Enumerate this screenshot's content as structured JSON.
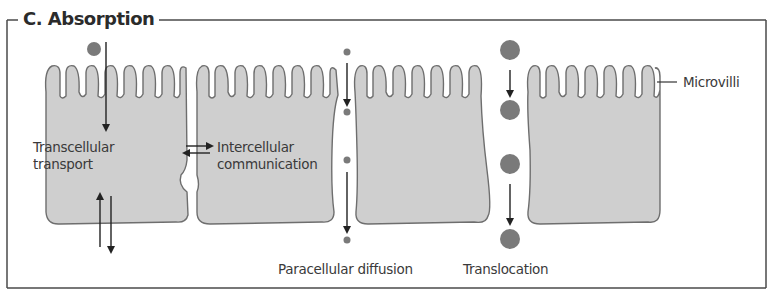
{
  "figure": {
    "title": "C. Absorption",
    "labels": {
      "microvilli": "Microvilli",
      "transcellular_line1": "Transcellular",
      "transcellular_line2": "transport",
      "intercellular_line1": "Intercellular",
      "intercellular_line2": "communication",
      "paracellular": "Paracellular diffusion",
      "translocation": "Translocation"
    },
    "colors": {
      "cell_fill": "#cfcfcf",
      "cell_stroke": "#6e6e6e",
      "particle": "#7a7a7a",
      "arrow": "#222222",
      "frame": "#4a4a4a"
    },
    "cells": [
      {
        "name": "enterocyte-1"
      },
      {
        "name": "enterocyte-2"
      },
      {
        "name": "enterocyte-3"
      },
      {
        "name": "enterocyte-4"
      }
    ],
    "pathways": [
      "Transcellular transport",
      "Intercellular communication",
      "Paracellular diffusion",
      "Translocation"
    ]
  }
}
